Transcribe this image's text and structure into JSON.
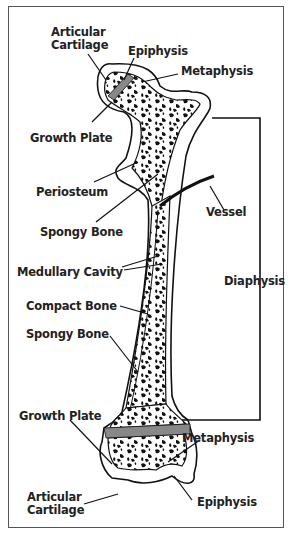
{
  "diagram": {
    "labels": {
      "articular_cartilage_top": [
        "Articular",
        "Cartilage"
      ],
      "epiphysis_top": "Epiphysis",
      "metaphysis_top": "Metaphysis",
      "growth_plate_top": "Growth Plate",
      "periosteum": "Periosteum",
      "spongy_bone_top": "Spongy Bone",
      "vessel": "Vessel",
      "medullary_cavity": "Medullary Cavity",
      "diaphysis": "Diaphysis",
      "compact_bone": "Compact Bone",
      "spongy_bone_bottom": "Spongy Bone",
      "growth_plate_bottom": "Growth Plate",
      "metaphysis_bottom": "Metaphysis",
      "articular_cartilage_bottom": [
        "Articular",
        "Cartilage"
      ],
      "epiphysis_bottom": "Epiphysis"
    },
    "colors": {
      "ink": "#111111",
      "growth_plate": "#888888",
      "border": "#555555",
      "background": "#ffffff"
    }
  }
}
